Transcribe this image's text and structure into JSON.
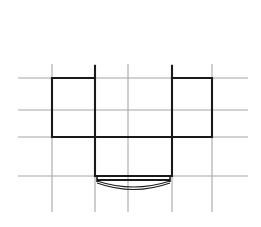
{
  "canvas": {
    "width": 261,
    "height": 227,
    "background_color": "#ffffff",
    "title": "technical-line-drawing"
  },
  "style": {
    "grid_color": "#a6a6a6",
    "grid_stroke_width": 1.1,
    "outline_color": "#1a1a1a",
    "outline_stroke_width": 2.1,
    "arc_color": "#1a1a1a",
    "arc_stroke_width": 1.2
  },
  "grid": {
    "horizontal_lines": [
      {
        "name": "h1",
        "y": 78,
        "x1": 18,
        "x2": 248
      },
      {
        "name": "h2",
        "y": 110,
        "x1": 18,
        "x2": 248
      },
      {
        "name": "h3",
        "y": 137,
        "x1": 18,
        "x2": 248
      },
      {
        "name": "h4",
        "y": 176,
        "x1": 18,
        "x2": 248
      }
    ],
    "vertical_lines": [
      {
        "name": "v1",
        "x": 52,
        "y1": 64,
        "y2": 212
      },
      {
        "name": "v2",
        "x": 95,
        "y1": 64,
        "y2": 212
      },
      {
        "name": "v3",
        "x": 128,
        "y1": 64,
        "y2": 212
      },
      {
        "name": "v4",
        "x": 172,
        "y1": 64,
        "y2": 212
      },
      {
        "name": "v5",
        "x": 212,
        "y1": 64,
        "y2": 212
      }
    ]
  },
  "shape": {
    "name": "inverted-t-profile",
    "description": "closed polyline forming an inverted T / bracket cross-section",
    "points": "52,78 95,78 95,176 172,176 172,78 212,78 212,137 172,137 172,176 95,176 95,137 52,137 52,78",
    "polyline_path": "M 52,78 L 95,78 L 95,137 L 52,137 Z M 95,137 L 95,176 L 172,176 L 172,137 M 172,137 L 172,78 L 212,78 L 212,137 Z",
    "outline_path": "M 52,137 L 52,78 L 95,78 L 95,137 L 95,176 L 172,176 L 172,137 L 172,78 L 212,78 L 212,137 L 172,137 L 95,137 L 52,137 Z"
  },
  "tick_marks": [
    {
      "name": "tick-left-stub",
      "x": 95,
      "y1": 65,
      "y2": 79
    },
    {
      "name": "tick-right-stub",
      "x": 172,
      "y1": 65,
      "y2": 79
    }
  ],
  "bottom_detail": {
    "name": "lens-arc-assembly",
    "bar": {
      "x1": 97,
      "y1": 180,
      "x2": 170,
      "y2": 180
    },
    "left_cap": {
      "x": 97,
      "y1": 176,
      "y2": 182
    },
    "right_cap": {
      "x": 170,
      "y1": 176,
      "y2": 182
    },
    "arc_upper": {
      "d": "M 97,181 Q 133.5,193 170,181",
      "sagitta": 6
    },
    "arc_lower": {
      "d": "M 97,183 Q 133.5,196 170,183",
      "sagitta": 7
    }
  },
  "labels": {
    "caption": ""
  }
}
